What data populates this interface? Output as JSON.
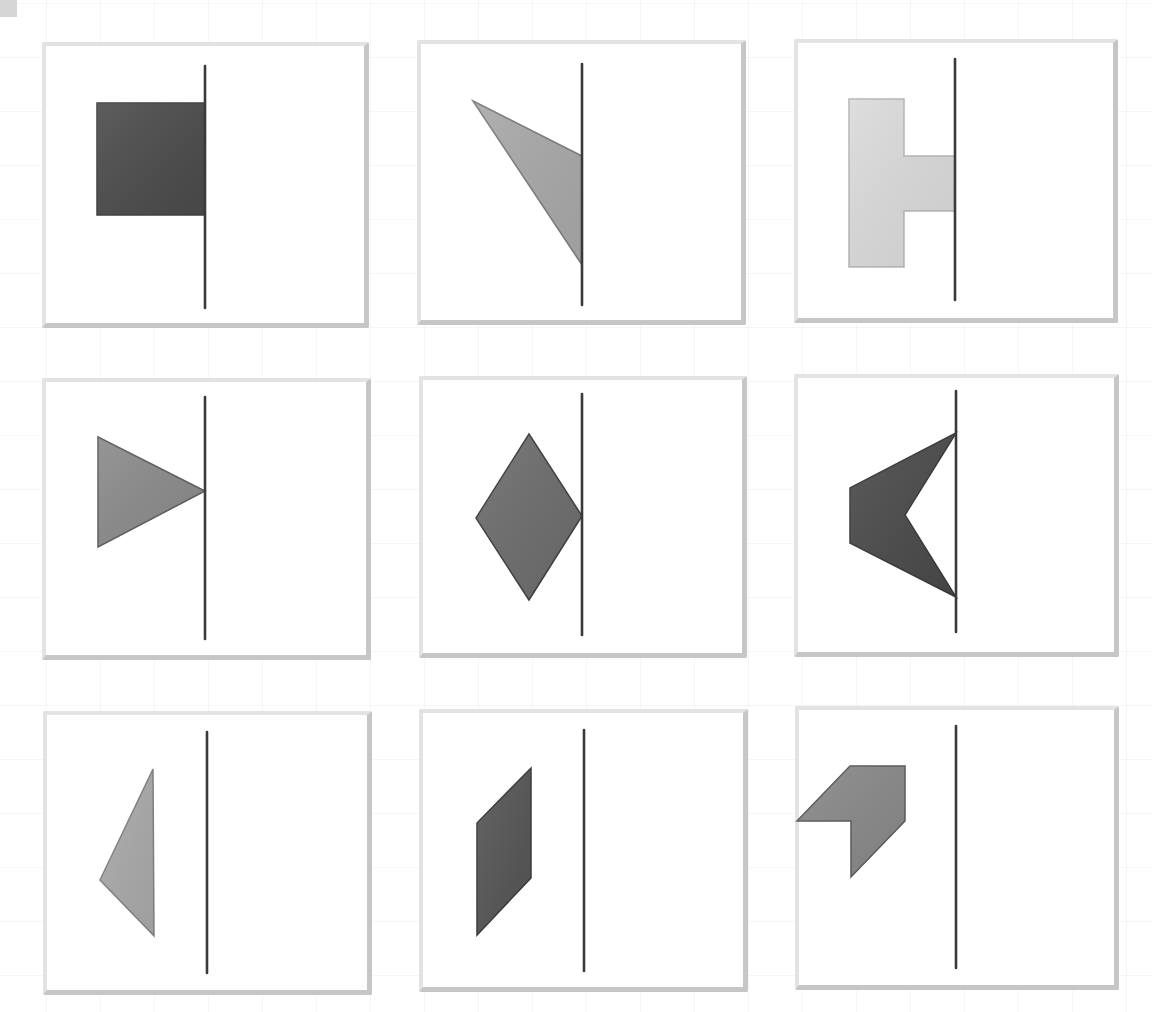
{
  "figure": {
    "type": "mirror-symmetry-puzzle-grid",
    "rows": 3,
    "cols": 3,
    "colors": {
      "background": "#ffffff",
      "grid_line": "#ededed",
      "panel_border_light": "#e3e3e3",
      "panel_border_dark": "#c6c6c6",
      "axis": "#3a3a3a",
      "shape_dark": "#4a4a4a",
      "shape_medium_dark": "#5e5e5e",
      "shape_medium": "#8c8c8c",
      "shape_light": "#a9a9a9",
      "shape_very_light": "#dcdcdc",
      "shape_stroke": "#555555"
    }
  },
  "panels": [
    {
      "id": "r1c1",
      "box": [
        42,
        42,
        327,
        286
      ],
      "axis": {
        "x": 205,
        "y1": 66,
        "y2": 308
      },
      "shape": {
        "name": "square",
        "fill": "#4b4b4b",
        "stroke": "#404040",
        "points": [
          [
            97,
            103
          ],
          [
            205,
            103
          ],
          [
            205,
            215
          ],
          [
            97,
            215
          ]
        ]
      }
    },
    {
      "id": "r1c2",
      "box": [
        417,
        40,
        329,
        285
      ],
      "axis": {
        "x": 582,
        "y1": 64,
        "y2": 305
      },
      "shape": {
        "name": "right-triangle-slanted",
        "fill": "#a8a8a8",
        "stroke": "#7a7a7a",
        "points": [
          [
            473,
            101
          ],
          [
            582,
            156
          ],
          [
            582,
            265
          ]
        ]
      }
    },
    {
      "id": "r1c3",
      "box": [
        794,
        39,
        324,
        284
      ],
      "axis": {
        "x": 955,
        "y1": 59,
        "y2": 300
      },
      "shape": {
        "name": "t-shape",
        "fill": "#dadada",
        "stroke": "#b5b5b5",
        "points": [
          [
            849,
            99
          ],
          [
            904,
            99
          ],
          [
            904,
            156
          ],
          [
            955,
            156
          ],
          [
            955,
            211
          ],
          [
            904,
            211
          ],
          [
            904,
            267
          ],
          [
            849,
            267
          ]
        ]
      }
    },
    {
      "id": "r2c1",
      "box": [
        42,
        378,
        329,
        282
      ],
      "axis": {
        "x": 205,
        "y1": 397,
        "y2": 639
      },
      "shape": {
        "name": "triangle-pointing-right",
        "fill": "#8a8a8a",
        "stroke": "#5e5e5e",
        "points": [
          [
            98,
            437
          ],
          [
            205,
            491
          ],
          [
            98,
            547
          ]
        ]
      }
    },
    {
      "id": "r2c2",
      "box": [
        419,
        376,
        328,
        282
      ],
      "axis": {
        "x": 582,
        "y1": 394,
        "y2": 635
      },
      "shape": {
        "name": "rhombus",
        "fill": "#6c6c6c",
        "stroke": "#3f3f3f",
        "points": [
          [
            529,
            434
          ],
          [
            582,
            516
          ],
          [
            529,
            600
          ],
          [
            476,
            518
          ]
        ]
      }
    },
    {
      "id": "r2c3",
      "box": [
        794,
        374,
        325,
        283
      ],
      "axis": {
        "x": 956,
        "y1": 391,
        "y2": 632
      },
      "shape": {
        "name": "arrowhead-concave",
        "fill": "#4a4a4a",
        "stroke": "#3a3a3a",
        "points": [
          [
            956,
            433
          ],
          [
            905,
            515
          ],
          [
            956,
            597
          ],
          [
            850,
            543
          ],
          [
            850,
            488
          ]
        ]
      }
    },
    {
      "id": "r3c1",
      "box": [
        43,
        711,
        329,
        284
      ],
      "axis": {
        "x": 207,
        "y1": 732,
        "y2": 973
      },
      "shape": {
        "name": "obtuse-triangle",
        "fill": "#a9a9a9",
        "stroke": "#808080",
        "points": [
          [
            153,
            769
          ],
          [
            154,
            936
          ],
          [
            100,
            880
          ]
        ]
      }
    },
    {
      "id": "r3c2",
      "box": [
        419,
        709,
        329,
        283
      ],
      "axis": {
        "x": 584,
        "y1": 730,
        "y2": 971
      },
      "shape": {
        "name": "parallelogram",
        "fill": "#555555",
        "stroke": "#3a3a3a",
        "points": [
          [
            531,
            768
          ],
          [
            531,
            878
          ],
          [
            477,
            935
          ],
          [
            477,
            823
          ]
        ]
      }
    },
    {
      "id": "r3c3",
      "box": [
        795,
        706,
        324,
        284
      ],
      "axis": {
        "x": 956,
        "y1": 726,
        "y2": 968
      },
      "shape": {
        "name": "chevron-notched-hexagon",
        "fill": "#888888",
        "stroke": "#5a5a5a",
        "points": [
          [
            850,
            766
          ],
          [
            905,
            766
          ],
          [
            905,
            821
          ],
          [
            851,
            877
          ],
          [
            851,
            821
          ],
          [
            797,
            821
          ]
        ]
      }
    }
  ]
}
